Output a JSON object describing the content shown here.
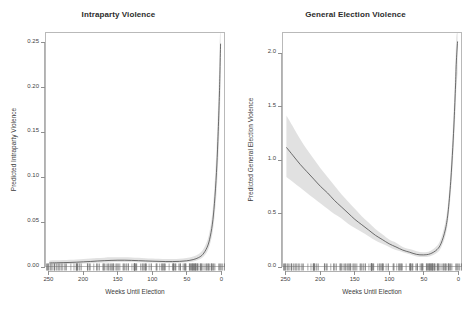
{
  "figure": {
    "background": "#ffffff",
    "line_color": "#4a4a4a",
    "band_color": "#d9d9d9",
    "axis_color": "#b0b0b0",
    "text_color": "#3b3b3b"
  },
  "chart_data": [
    {
      "type": "line",
      "title": "Intraparty Violence",
      "xlabel": "Weeks Until Election",
      "ylabel": "Predicted Intraparty Violence",
      "xlim": [
        255,
        -5
      ],
      "ylim": [
        0.0,
        0.262
      ],
      "x_ticks": [
        250,
        200,
        150,
        100,
        50,
        0
      ],
      "x_tick_labels": [
        "250",
        "200",
        "150",
        "100",
        "50",
        "0"
      ],
      "y_ticks": [
        0.0,
        0.05,
        0.1,
        0.15,
        0.2,
        0.25
      ],
      "y_tick_labels": [
        "0.00",
        "0.05",
        "0.10",
        "0.15",
        "0.20",
        "0.25"
      ],
      "grid": false,
      "legend": "none",
      "x_axis_reversed": true,
      "rug": true,
      "series": [
        {
          "name": "Predicted Intraparty Violence",
          "x": [
            250,
            240,
            230,
            220,
            210,
            200,
            190,
            180,
            170,
            160,
            150,
            140,
            130,
            120,
            110,
            100,
            90,
            80,
            70,
            60,
            50,
            40,
            32,
            26,
            20,
            16,
            12,
            9,
            6,
            4,
            2,
            1,
            0
          ],
          "values": [
            0.0035,
            0.0036,
            0.0038,
            0.004,
            0.0043,
            0.0047,
            0.0051,
            0.0056,
            0.006,
            0.0063,
            0.0065,
            0.0065,
            0.0063,
            0.006,
            0.0057,
            0.0054,
            0.0052,
            0.005,
            0.005,
            0.0052,
            0.0058,
            0.0072,
            0.0095,
            0.013,
            0.0205,
            0.03,
            0.047,
            0.07,
            0.105,
            0.14,
            0.185,
            0.215,
            0.25
          ],
          "ci_lower": [
            0.0018,
            0.0019,
            0.002,
            0.0022,
            0.0025,
            0.0028,
            0.0032,
            0.0036,
            0.004,
            0.0043,
            0.0045,
            0.0045,
            0.0044,
            0.0042,
            0.004,
            0.0038,
            0.0036,
            0.0035,
            0.0035,
            0.0036,
            0.0041,
            0.0052,
            0.007,
            0.0098,
            0.0155,
            0.023,
            0.036,
            0.054,
            0.081,
            0.109,
            0.145,
            0.17,
            0.2
          ],
          "ci_upper": [
            0.0062,
            0.0064,
            0.0067,
            0.007,
            0.0074,
            0.0079,
            0.0084,
            0.0089,
            0.0094,
            0.0097,
            0.0099,
            0.0099,
            0.0096,
            0.0092,
            0.0088,
            0.0084,
            0.0081,
            0.0078,
            0.0078,
            0.0081,
            0.0089,
            0.0107,
            0.0135,
            0.018,
            0.0272,
            0.039,
            0.06,
            0.088,
            0.13,
            0.172,
            0.225,
            0.258,
            0.262
          ]
        }
      ]
    },
    {
      "type": "line",
      "title": "General Election Violence",
      "xlabel": "Weeks Until Election",
      "ylabel": "Predicted General Election Violence",
      "xlim": [
        255,
        -5
      ],
      "ylim": [
        0.0,
        2.2
      ],
      "x_ticks": [
        250,
        200,
        150,
        100,
        50,
        0
      ],
      "x_tick_labels": [
        "250",
        "200",
        "150",
        "100",
        "50",
        "0"
      ],
      "y_ticks": [
        0.0,
        0.5,
        1.0,
        1.5,
        2.0
      ],
      "y_tick_labels": [
        "0.0",
        "0.5",
        "1.0",
        "1.5",
        "2.0"
      ],
      "grid": false,
      "legend": "none",
      "x_axis_reversed": true,
      "rug": true,
      "series": [
        {
          "name": "Predicted General Election Violence",
          "x": [
            250,
            240,
            230,
            220,
            210,
            200,
            190,
            180,
            170,
            160,
            150,
            140,
            130,
            120,
            110,
            100,
            90,
            80,
            70,
            60,
            50,
            40,
            30,
            24,
            18,
            14,
            10,
            7,
            5,
            3,
            2,
            1,
            0
          ],
          "values": [
            1.12,
            1.04,
            0.96,
            0.89,
            0.82,
            0.75,
            0.69,
            0.62,
            0.56,
            0.5,
            0.44,
            0.39,
            0.34,
            0.29,
            0.25,
            0.21,
            0.18,
            0.15,
            0.13,
            0.11,
            0.105,
            0.115,
            0.155,
            0.215,
            0.34,
            0.5,
            0.8,
            1.12,
            1.38,
            1.7,
            1.9,
            2.02,
            2.12
          ],
          "ci_lower": [
            0.84,
            0.79,
            0.74,
            0.69,
            0.64,
            0.59,
            0.54,
            0.49,
            0.45,
            0.4,
            0.36,
            0.32,
            0.28,
            0.24,
            0.21,
            0.18,
            0.15,
            0.13,
            0.11,
            0.09,
            0.085,
            0.093,
            0.125,
            0.175,
            0.28,
            0.42,
            0.68,
            0.96,
            1.19,
            1.47,
            1.64,
            1.74,
            1.82
          ],
          "ci_upper": [
            1.42,
            1.31,
            1.2,
            1.1,
            1.01,
            0.92,
            0.84,
            0.76,
            0.68,
            0.61,
            0.54,
            0.47,
            0.41,
            0.35,
            0.3,
            0.25,
            0.22,
            0.18,
            0.16,
            0.14,
            0.13,
            0.142,
            0.19,
            0.265,
            0.41,
            0.59,
            0.93,
            1.29,
            1.58,
            1.94,
            2.14,
            2.2,
            2.2
          ]
        }
      ]
    }
  ]
}
